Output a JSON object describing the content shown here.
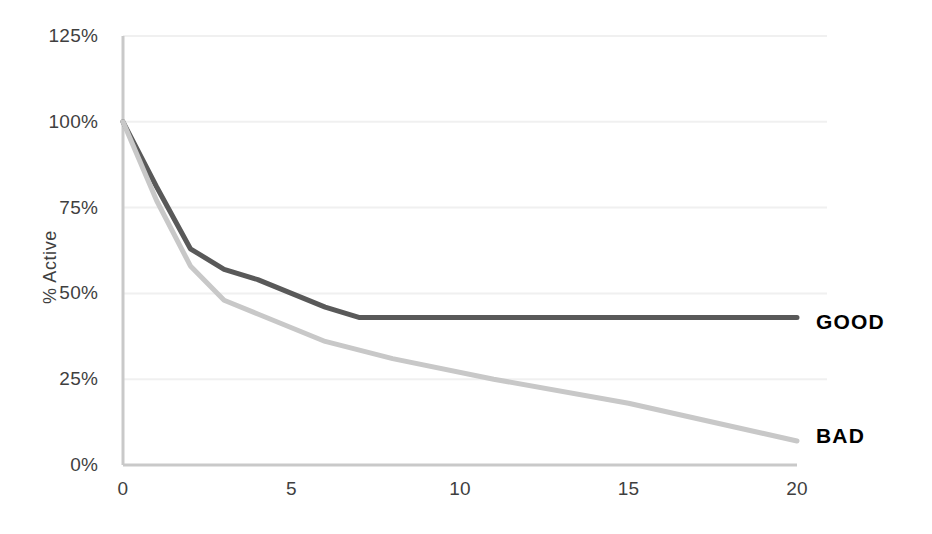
{
  "chart_data": {
    "type": "line",
    "title": "",
    "subtitle": "",
    "xlabel": "",
    "ylabel": "% Active",
    "xlim": [
      0,
      20
    ],
    "ylim": [
      0,
      125
    ],
    "grid": true,
    "grid_axis": "y",
    "legend_position": "right-inline",
    "x_ticks": [
      0,
      5,
      10,
      15,
      20
    ],
    "x_tick_labels": [
      "0",
      "5",
      "10",
      "15",
      "20"
    ],
    "y_ticks": [
      0,
      25,
      50,
      75,
      100,
      125
    ],
    "y_tick_labels": [
      "0%",
      "25%",
      "50%",
      "75%",
      "100%",
      "125%"
    ],
    "series": [
      {
        "name": "GOOD",
        "color": "#595959",
        "x": [
          0,
          1,
          2,
          3,
          4,
          5,
          6,
          7,
          10,
          15,
          20
        ],
        "values": [
          100,
          81,
          63,
          57,
          54,
          50,
          46,
          43,
          43,
          43,
          43
        ]
      },
      {
        "name": "BAD",
        "color": "#c8c8c8",
        "x": [
          0,
          1,
          2,
          3,
          4,
          5,
          6,
          8,
          11,
          15,
          20
        ],
        "values": [
          100,
          77,
          58,
          48,
          44,
          40,
          36,
          31,
          25,
          18,
          7
        ]
      }
    ]
  },
  "axes": {
    "y_title": "% Active",
    "axis_color": "#c9c9c9",
    "grid_color": "#f0f0f0",
    "tick_text_color": "#3f3f3f"
  },
  "legend": {
    "items": [
      {
        "label": "GOOD",
        "color": "#595959"
      },
      {
        "label": "BAD",
        "color": "#c8c8c8"
      }
    ]
  }
}
